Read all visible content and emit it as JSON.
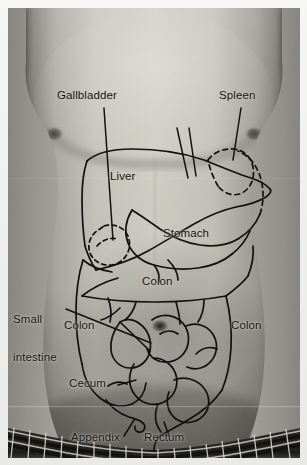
{
  "figure": {
    "kind": "anatomical-photo-overlay",
    "photo": {
      "left": 8,
      "top": 8,
      "width": 292,
      "height": 450,
      "tone": "grayscale"
    },
    "colors": {
      "page_background": "#f2f2f0",
      "label_text": "#16130f",
      "outline_stroke": "#0d0c0a",
      "skin_light": "#cfccc4",
      "skin_mid": "#a7a49c",
      "skin_shadow": "#55534d",
      "waistband_dark": "#1b1a18",
      "waistband_light": "#d8d5cc"
    }
  },
  "labels": [
    {
      "id": "gallbladder",
      "text": "Gallbladder",
      "x": 57,
      "y": 89,
      "lines": [
        "Gallbladder"
      ],
      "leader": true
    },
    {
      "id": "spleen",
      "text": "Spleen",
      "x": 219,
      "y": 89,
      "lines": [
        "Spleen"
      ],
      "leader": true
    },
    {
      "id": "liver",
      "text": "Liver",
      "x": 110,
      "y": 170,
      "lines": [
        "Liver"
      ],
      "leader": false
    },
    {
      "id": "stomach",
      "text": "Stomach",
      "x": 163,
      "y": 227,
      "lines": [
        "Stomach"
      ],
      "leader": false
    },
    {
      "id": "colon-middle",
      "text": "Colon",
      "x": 142,
      "y": 275,
      "lines": [
        "Colon"
      ],
      "leader": false
    },
    {
      "id": "small-intestine",
      "text": "Small intestine",
      "x": 13,
      "y": 287,
      "lines": [
        "Small",
        "intestine"
      ],
      "leader": true
    },
    {
      "id": "colon-left",
      "text": "Colon",
      "x": 64,
      "y": 319,
      "lines": [
        "Colon"
      ],
      "leader": false
    },
    {
      "id": "colon-right",
      "text": "Colon",
      "x": 231,
      "y": 319,
      "lines": [
        "Colon"
      ],
      "leader": false
    },
    {
      "id": "cecum",
      "text": "Cecum",
      "x": 69,
      "y": 377,
      "lines": [
        "Cecum"
      ],
      "leader": true
    },
    {
      "id": "appendix",
      "text": "Appendix",
      "x": 71,
      "y": 431,
      "lines": [
        "Appendix"
      ],
      "leader": true
    },
    {
      "id": "rectum",
      "text": "Rectum",
      "x": 144,
      "y": 431,
      "lines": [
        "Rectum"
      ],
      "leader": true
    }
  ],
  "label_text": {
    "gallbladder": "Gallbladder",
    "spleen": "Spleen",
    "liver": "Liver",
    "stomach": "Stomach",
    "colon_middle": "Colon",
    "small_intestine_line1": "Small",
    "small_intestine_line2": "intestine",
    "colon_left": "Colon",
    "colon_right": "Colon",
    "cecum": "Cecum",
    "appendix": "Appendix",
    "rectum": "Rectum"
  },
  "organs_drawn": [
    {
      "name": "liver",
      "stroke": "solid"
    },
    {
      "name": "stomach",
      "stroke": "solid"
    },
    {
      "name": "spleen",
      "stroke": "dashed"
    },
    {
      "name": "gallbladder",
      "stroke": "dashed"
    },
    {
      "name": "ascending-colon",
      "stroke": "solid"
    },
    {
      "name": "transverse-colon",
      "stroke": "solid"
    },
    {
      "name": "descending-colon",
      "stroke": "solid"
    },
    {
      "name": "small-intestine",
      "stroke": "solid"
    },
    {
      "name": "cecum",
      "stroke": "solid"
    },
    {
      "name": "appendix",
      "stroke": "solid"
    },
    {
      "name": "rectum",
      "stroke": "solid"
    }
  ]
}
